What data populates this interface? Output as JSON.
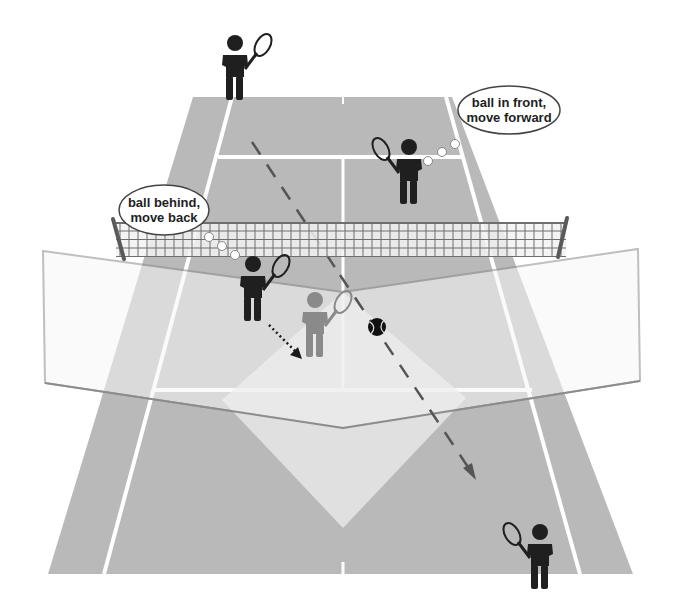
{
  "diagram": {
    "colors": {
      "background": "#ffffff",
      "court": "#b9b9b9",
      "court_line": "#ffffff",
      "panel_fill": "#eeeeee",
      "panel_border": "#8c8c8c",
      "highlight_zone": "#e8e8e8",
      "player": "#1f1f1f",
      "ghost_player": "#8a8a8a",
      "trajectory": "#555555",
      "net": "#6e6e6e",
      "ball": "#111111"
    },
    "callouts": [
      {
        "id": "far",
        "line1": "ball in front,",
        "line2": "move forward",
        "cx": 509,
        "cy": 110
      },
      {
        "id": "near",
        "line1": "ball behind,",
        "line2": "move back",
        "cx": 164,
        "cy": 210
      }
    ],
    "players": [
      {
        "id": "far-left-baseline",
        "role": "opponent",
        "x": 235,
        "y": 43,
        "racket_side": "right"
      },
      {
        "id": "far-right-service",
        "role": "opponent",
        "x": 409,
        "y": 147,
        "racket_side": "left"
      },
      {
        "id": "near-net-player",
        "role": "player",
        "x": 253,
        "y": 264,
        "racket_side": "right"
      },
      {
        "id": "near-net-player-moved",
        "role": "ghost",
        "x": 315,
        "y": 300,
        "racket_side": "right"
      },
      {
        "id": "near-right-baseline",
        "role": "partner",
        "x": 540,
        "y": 532,
        "racket_side": "left"
      }
    ],
    "ball": {
      "x": 377,
      "y": 327,
      "r": 9
    },
    "trajectory": {
      "from": [
        252,
        142
      ],
      "to": [
        475,
        478
      ],
      "style": "dashed-arrow"
    },
    "movement_arrow": {
      "from": [
        269,
        325
      ],
      "to": [
        301,
        358
      ],
      "style": "dotted-arrow"
    }
  }
}
